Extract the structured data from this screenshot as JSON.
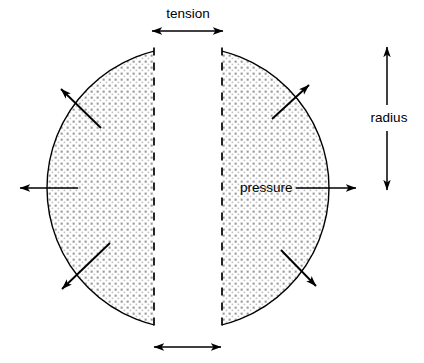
{
  "figure": {
    "title_visible": false,
    "background_color": "#ffffff",
    "stroke_color": "#000000",
    "fill_pattern": "stipple-dots",
    "fill_color": "#e8e8e8"
  },
  "labels": {
    "tension": "tension",
    "pressure": "pressure",
    "radius": "radius"
  },
  "shape": {
    "type": "split-circle",
    "center_x": 188,
    "center_y": 188,
    "radius": 141,
    "gap_left_x": 154,
    "gap_right_x": 222,
    "inner_edge_style": "dashed"
  },
  "annotations": {
    "tension_arrow_top": {
      "label": "tension",
      "style": "double-headed",
      "orientation": "horizontal",
      "x1": 152,
      "x2": 223,
      "y": 31
    },
    "tension_arrow_bottom": {
      "style": "double-headed",
      "orientation": "horizontal",
      "x1": 154,
      "x2": 221,
      "y": 347
    },
    "radius_arrow": {
      "label": "radius",
      "style": "double-headed",
      "orientation": "vertical",
      "x": 387,
      "y1": 47,
      "y2": 190,
      "label_x": 389,
      "label_y": 118
    },
    "pressure_arrow": {
      "label": "pressure",
      "style": "single-headed",
      "direction": "right",
      "x1": 296,
      "x2": 356,
      "y": 188,
      "label_x": 240,
      "label_y": 188
    },
    "left_radial_arrow": {
      "style": "single-headed",
      "direction": "left",
      "x1": 78,
      "x2": 20,
      "y": 188
    },
    "radial_arrows": [
      {
        "name": "upper-left",
        "x1": 101,
        "y1": 128,
        "x2": 61,
        "y2": 89,
        "direction": "up-left"
      },
      {
        "name": "lower-left",
        "x1": 110,
        "y1": 243,
        "x2": 62,
        "y2": 289,
        "direction": "down-left"
      },
      {
        "name": "upper-right",
        "x1": 272,
        "y1": 119,
        "x2": 309,
        "y2": 85,
        "direction": "up-right"
      },
      {
        "name": "lower-right",
        "x1": 281,
        "y1": 250,
        "x2": 316,
        "y2": 286,
        "direction": "down-right"
      }
    ]
  }
}
